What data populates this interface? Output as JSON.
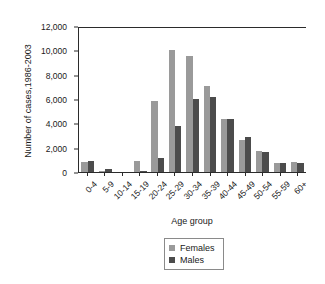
{
  "chart_data": {
    "type": "bar",
    "title": "",
    "xlabel": "Age group",
    "ylabel": "Number of cases,1986-2003",
    "ylim": [
      0,
      12000
    ],
    "yticks": [
      0,
      2000,
      4000,
      6000,
      8000,
      10000,
      12000
    ],
    "ytick_labels": [
      "0",
      "2,000",
      "4,000",
      "6,000",
      "8,000",
      "10,000",
      "12,000"
    ],
    "grid": false,
    "legend_position": "bottom-center",
    "categories": [
      "0-4",
      "5-9",
      "10-14",
      "15-19",
      "20-24",
      "25-29",
      "30-34",
      "35-39",
      "40-44",
      "45-49",
      "50-54",
      "55-59",
      "60+"
    ],
    "series": [
      {
        "name": "Females",
        "color": "#9a9a9a",
        "values": [
          900,
          200,
          80,
          1000,
          5900,
          10150,
          9600,
          7150,
          4400,
          2700,
          1850,
          800,
          930
        ]
      },
      {
        "name": "Males",
        "color": "#4c4c4c",
        "values": [
          950,
          350,
          60,
          180,
          1250,
          3900,
          6100,
          6250,
          4400,
          3000,
          1700,
          800,
          830
        ]
      }
    ]
  },
  "legend": {
    "items": [
      {
        "label": "Females",
        "swatch": "females-swatch"
      },
      {
        "label": "Males",
        "swatch": "males-swatch"
      }
    ]
  },
  "colors": {
    "females": "#9a9a9a",
    "males": "#4c4c4c",
    "axis": "#2b2b2b",
    "background": "#ffffff"
  }
}
